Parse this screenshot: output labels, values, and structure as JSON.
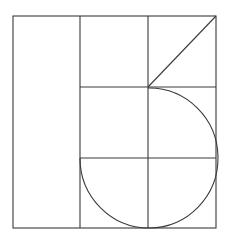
{
  "diagram": {
    "type": "geometric-grid-figure",
    "canvas": {
      "width": 229,
      "height": 243,
      "background": "#ffffff"
    },
    "stroke_color": "#3a3a3a",
    "outer_rect": {
      "x1": 13,
      "y1": 16,
      "x2": 216,
      "y2": 228
    },
    "vertical_lines_x": [
      80,
      148
    ],
    "grid_horizontal_lines": [
      {
        "y": 87,
        "x1": 80,
        "x2": 216
      },
      {
        "y": 158,
        "x1": 80,
        "x2": 216
      }
    ],
    "diagonal": {
      "x1": 148,
      "y1": 87,
      "x2": 216,
      "y2": 16
    },
    "arc": {
      "center": [
        148,
        158
      ],
      "radius": 69,
      "coverage": "three-quarter circle (top-right, bottom-right, bottom-left quadrants)",
      "start": [
        148,
        88
      ],
      "end": [
        80,
        158
      ]
    }
  }
}
